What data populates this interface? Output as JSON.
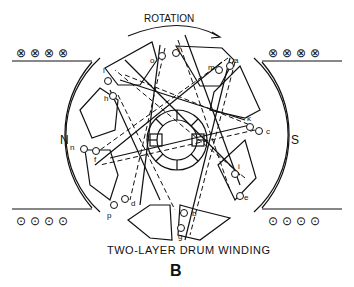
{
  "title": "TWO-LAYER DRUM WINDING",
  "figure_letter": "B",
  "rotation_label": "ROTATION",
  "poles": {
    "north": "N",
    "south": "S"
  },
  "conductor_symbols": {
    "into_page": "⊗",
    "out_of_page": "⊙"
  },
  "field_conductors": {
    "top_left": [
      "⊗",
      "⊗",
      "⊗",
      "⊗"
    ],
    "top_right": [
      "⊗",
      "⊗",
      "⊗",
      "⊗"
    ],
    "bottom_left": [
      "⊙",
      "⊙",
      "⊙",
      "⊙"
    ],
    "bottom_right": [
      "⊙",
      "⊙",
      "⊙",
      "⊙"
    ]
  },
  "coil_labels": [
    "a",
    "b",
    "c",
    "d",
    "e",
    "f",
    "g",
    "h",
    "i",
    "j",
    "k",
    "l",
    "m",
    "n",
    "o",
    "p"
  ],
  "colors": {
    "ink": "#111111",
    "background": "#ffffff"
  }
}
